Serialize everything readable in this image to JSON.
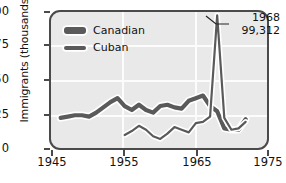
{
  "chart_data": {
    "type": "line",
    "title": "",
    "xlabel": "",
    "ylabel": "Immigrants (thousands)",
    "xlim": [
      1945,
      1975
    ],
    "ylim": [
      0,
      100
    ],
    "grid": true,
    "xticks": [
      "1945",
      "1955",
      "1965",
      "1975"
    ],
    "yticks": [
      "0",
      "25",
      "50",
      "75",
      "100"
    ],
    "legend_position": "top-left",
    "series": [
      {
        "name": "Canadian",
        "color": "#5a5a5a",
        "x": [
          1946,
          1947,
          1948,
          1949,
          1950,
          1951,
          1952,
          1953,
          1954,
          1955,
          1956,
          1957,
          1958,
          1959,
          1960,
          1961,
          1962,
          1963,
          1964,
          1965,
          1966,
          1967,
          1968,
          1969,
          1970,
          1971,
          1972
        ],
        "values": [
          21,
          22,
          23,
          23,
          22,
          25,
          29,
          33,
          36,
          30,
          27,
          31,
          27,
          25,
          30,
          31,
          29,
          28,
          34,
          36,
          38,
          30,
          26,
          13,
          12,
          12,
          20
        ]
      },
      {
        "name": "Cuban",
        "color": "#5a5a5a",
        "x": [
          1955,
          1956,
          1957,
          1958,
          1959,
          1960,
          1961,
          1962,
          1963,
          1964,
          1965,
          1966,
          1967,
          1968,
          1969,
          1970,
          1971,
          1972
        ],
        "values": [
          8,
          11,
          15,
          12,
          7,
          5,
          9,
          14,
          12,
          10,
          17,
          18,
          22,
          99,
          21,
          12,
          13,
          18
        ]
      }
    ],
    "annotations": [
      {
        "name": "cuban-peak-1968",
        "year": "1968",
        "value": "99,312",
        "points_to": {
          "x": 1968,
          "y": 99
        }
      }
    ]
  },
  "legend": {
    "items": [
      {
        "label": "Canadian",
        "swatch": "thick-dark-swatch"
      },
      {
        "label": "Cuban",
        "swatch": "thin-dark-swatch"
      }
    ]
  }
}
